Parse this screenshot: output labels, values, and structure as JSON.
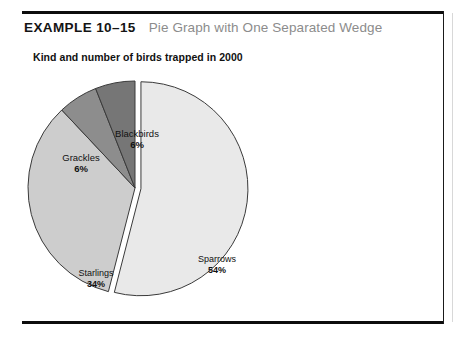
{
  "header": {
    "example_label": "EXAMPLE 10–15",
    "example_title": "Pie Graph with One Separated Wedge"
  },
  "chart_data": {
    "type": "pie",
    "title": "Kind and number of birds trapped in 2000",
    "subtitle": "",
    "xlabel": "",
    "ylabel": "",
    "grid": false,
    "legend_position": "none",
    "labels_position": "callout-and-inside",
    "exploded_slice": "Sparrows",
    "start_angle_deg": -90,
    "direction": "clockwise",
    "categories": [
      "Sparrows",
      "Starlings",
      "Grackles",
      "Blackbirds"
    ],
    "values": [
      54,
      34,
      6,
      6
    ],
    "value_unit": "percent",
    "slices": [
      {
        "name": "Sparrows",
        "percent": 54,
        "label": "Sparrows",
        "percent_label": "54%",
        "color": "#e9e9e9",
        "exploded": true,
        "label_placement": "inside"
      },
      {
        "name": "Starlings",
        "percent": 34,
        "label": "Starlings",
        "percent_label": "34%",
        "color": "#cdcdcd",
        "exploded": false,
        "label_placement": "inside"
      },
      {
        "name": "Grackles",
        "percent": 6,
        "label": "Grackles",
        "percent_label": "6%",
        "color": "#8d8d8d",
        "exploded": false,
        "label_placement": "outside"
      },
      {
        "name": "Blackbirds",
        "percent": 6,
        "label": "Blackbirds",
        "percent_label": "6%",
        "color": "#767676",
        "exploded": false,
        "label_placement": "outside"
      }
    ],
    "outline_color": "#3a3a3a",
    "background": "#ffffff"
  },
  "frame": {
    "rule_color": "#0d0d0d"
  }
}
